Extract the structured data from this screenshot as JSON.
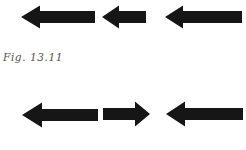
{
  "figure": {
    "caption": "Fig. 13.11",
    "ink_color": "#161616",
    "caption_color": "#54504a",
    "background": "#ffffff",
    "canvas": {
      "width": 246,
      "height": 150
    },
    "rows": [
      {
        "id": "top-row",
        "arrows": [
          {
            "dir": "left",
            "x1": 21,
            "x2": 95,
            "cy": 17,
            "head_len": 19,
            "head_h": 23,
            "shaft_h": 12
          },
          {
            "dir": "left",
            "x1": 102,
            "x2": 146,
            "cy": 17,
            "head_len": 17,
            "head_h": 23,
            "shaft_h": 12
          },
          {
            "dir": "left",
            "x1": 165,
            "x2": 242,
            "cy": 17,
            "head_len": 18,
            "head_h": 23,
            "shaft_h": 12
          }
        ]
      },
      {
        "id": "bottom-row",
        "arrows": [
          {
            "dir": "left",
            "x1": 22,
            "x2": 98,
            "cy": 115,
            "head_len": 20,
            "head_h": 25,
            "shaft_h": 12
          },
          {
            "dir": "right",
            "x1": 103,
            "x2": 150,
            "cy": 114,
            "head_len": 15,
            "head_h": 25,
            "shaft_h": 12
          },
          {
            "dir": "left",
            "x1": 166,
            "x2": 243,
            "cy": 114,
            "head_len": 19,
            "head_h": 25,
            "shaft_h": 12
          }
        ]
      }
    ]
  }
}
